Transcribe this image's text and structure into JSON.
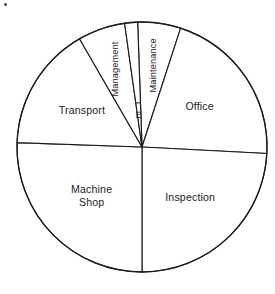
{
  "figure": {
    "kind": "pie-chart",
    "background_color": "#ffffff",
    "line_color": "#1c1c1c",
    "text_color": "#1c1c1c",
    "corner_mark": "•"
  },
  "chart_data": {
    "type": "pie",
    "title": "",
    "subtitle": "",
    "xlabel": "",
    "ylabel": "",
    "grid": false,
    "legend": "none",
    "labels_position": "inside-slices",
    "center": {
      "x": 142,
      "y": 147
    },
    "radius": 125,
    "start_angle_deg": 358,
    "direction": "clockwise",
    "categories": [
      "Maintenance",
      "Office",
      "Inspection",
      "Machine Shop",
      "Transport",
      "Management",
      "m"
    ],
    "values": [
      5.6,
      20.8,
      24.2,
      25.6,
      16.1,
      6.1,
      1.6
    ],
    "value_unit": "percent",
    "slices": [
      {
        "label": "Maintenance",
        "percent": 5.6,
        "angle_deg": 20,
        "start_deg": 358,
        "end_deg": 18,
        "label_rotation_deg": -90,
        "label_size": "small"
      },
      {
        "label": "Office",
        "percent": 20.8,
        "angle_deg": 75,
        "start_deg": 18,
        "end_deg": 93,
        "label_rotation_deg": 0,
        "label_size": "normal"
      },
      {
        "label": "Inspection",
        "percent": 24.2,
        "angle_deg": 87,
        "start_deg": 93,
        "end_deg": 180,
        "label_rotation_deg": 0,
        "label_size": "normal"
      },
      {
        "label": "Machine Shop",
        "percent": 25.6,
        "angle_deg": 92,
        "start_deg": 180,
        "end_deg": 272,
        "label_rotation_deg": 0,
        "label_size": "normal",
        "label_line_1": "Machine",
        "label_line_2": "Shop"
      },
      {
        "label": "Transport",
        "percent": 16.1,
        "angle_deg": 58,
        "start_deg": 272,
        "end_deg": 330,
        "label_rotation_deg": 0,
        "label_size": "normal"
      },
      {
        "label": "Management",
        "percent": 6.1,
        "angle_deg": 22,
        "start_deg": 330,
        "end_deg": 352,
        "label_rotation_deg": -90,
        "label_size": "small"
      },
      {
        "label": "m",
        "percent": 1.6,
        "angle_deg": 6,
        "start_deg": 352,
        "end_deg": 358,
        "label_rotation_deg": -90,
        "label_size": "tiny"
      }
    ]
  }
}
